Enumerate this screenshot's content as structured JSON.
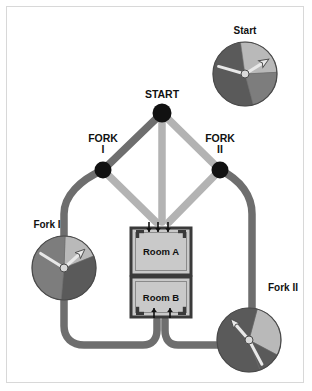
{
  "figure": {
    "background_color": "#ffffff",
    "frame_color": "#d8d8d8"
  },
  "palette": {
    "path_dark": "#6e6e6e",
    "path_light": "#b3b3b3",
    "node_fill": "#111111",
    "room_fill": "#c9c9c9",
    "room_border": "#3a3a3a",
    "dial_dark": "#5a5a5a",
    "dial_medium": "#7d7d7d",
    "dial_light": "#b9b9b9",
    "dial_hub": "#d9d9d9",
    "arrow_fill": "#111111",
    "needle_fill": "#e8e8e8",
    "text_color": "#111111"
  },
  "nodes": [
    {
      "id": "start",
      "label_line1": "START",
      "label_line2": "",
      "cx": 162,
      "cy": 113,
      "r": 9.5
    },
    {
      "id": "fork1",
      "label_line1": "FORK",
      "label_line2": "I",
      "cx": 103,
      "cy": 170,
      "r": 8.5
    },
    {
      "id": "fork2",
      "label_line1": "FORK",
      "label_line2": "II",
      "cx": 220,
      "cy": 170,
      "r": 8.5
    }
  ],
  "rooms": [
    {
      "id": "room-a",
      "label": "Room A",
      "x": 131,
      "y": 228,
      "w": 60,
      "h": 47
    },
    {
      "id": "room-b",
      "label": "Room B",
      "x": 131,
      "y": 277,
      "w": 60,
      "h": 40
    }
  ],
  "dials": [
    {
      "id": "dial-start",
      "label": "Start",
      "cx": 245,
      "cy": 74,
      "r": 32,
      "label_x": 245,
      "label_y": 34,
      "arrow_angle_deg": -32,
      "needle_angle_deg": 196,
      "segments": [
        {
          "name": "dark-left",
          "start_deg": 75,
          "end_deg": 262,
          "color": "#5a5a5a"
        },
        {
          "name": "light-upper-right",
          "start_deg": 262,
          "end_deg": 357,
          "color": "#b9b9b9"
        },
        {
          "name": "medium-lower-right",
          "start_deg": 357,
          "end_deg": 75,
          "color": "#7d7d7d"
        }
      ]
    },
    {
      "id": "dial-fork1",
      "label": "Fork I",
      "cx": 64,
      "cy": 268,
      "r": 32,
      "label_x": 47,
      "label_y": 228,
      "arrow_angle_deg": -42,
      "needle_angle_deg": 212,
      "segments": [
        {
          "name": "light-top-right",
          "start_deg": 272,
          "end_deg": 338,
          "color": "#b9b9b9"
        },
        {
          "name": "dark-right",
          "start_deg": 338,
          "end_deg": 95,
          "color": "#5a5a5a"
        },
        {
          "name": "medium-left",
          "start_deg": 95,
          "end_deg": 272,
          "color": "#7d7d7d"
        }
      ]
    },
    {
      "id": "dial-fork2",
      "label": "Fork II",
      "cx": 249,
      "cy": 340,
      "r": 32,
      "label_x": 283,
      "label_y": 291,
      "arrow_angle_deg": -131,
      "needle_angle_deg": 62,
      "segments": [
        {
          "name": "light-right",
          "start_deg": 285,
          "end_deg": 28,
          "color": "#b9b9b9"
        },
        {
          "name": "dark-lower-right",
          "start_deg": 28,
          "end_deg": 70,
          "color": "#5a5a5a"
        },
        {
          "name": "dark-left",
          "start_deg": 70,
          "end_deg": 285,
          "color": "#5a5a5a"
        }
      ]
    }
  ],
  "paths": [
    {
      "id": "start-to-fork1",
      "kind": "dark",
      "d": "M 162 113 L 103 170"
    },
    {
      "id": "start-to-fork2",
      "kind": "light",
      "d": "M 162 113 L 220 170"
    },
    {
      "id": "start-to-room-a",
      "kind": "light",
      "d": "M 162 113 L 162 222"
    },
    {
      "id": "fork1-to-room-a",
      "kind": "light",
      "d": "M 103 170 L 156 222"
    },
    {
      "id": "fork2-to-room-a",
      "kind": "light",
      "d": "M 220 170 L 169 222"
    },
    {
      "id": "fork1-left-loop",
      "kind": "dark",
      "d": "M 103 170 C 80 180 64 196 64 214 L 64 326 C 64 338 72 345 84 345 L 143 345 C 152 345 157 339 157 330 L 157 320"
    },
    {
      "id": "fork2-right-loop",
      "kind": "dark",
      "d": "M 220 170 C 241 180 252 196 252 214 L 252 326 C 252 338 244 345 233 345 L 178 345 C 169 345 165 339 165 330 L 165 320"
    }
  ],
  "room_arrows": {
    "room_a_top": [
      {
        "x": 149,
        "y_from": 222,
        "y_to": 232
      },
      {
        "x": 158,
        "y_from": 222,
        "y_to": 232
      },
      {
        "x": 168,
        "y_from": 222,
        "y_to": 232
      }
    ],
    "room_b_bottom": [
      {
        "x": 154,
        "y_from": 318,
        "y_to": 308
      },
      {
        "x": 170,
        "y_from": 318,
        "y_to": 308
      }
    ]
  }
}
